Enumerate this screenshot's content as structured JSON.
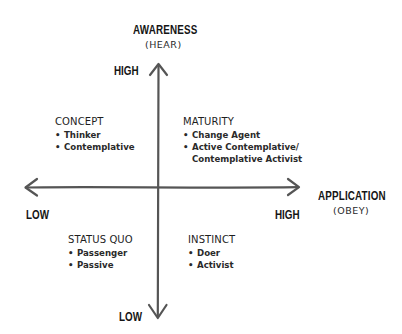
{
  "vertical_axis": {
    "title": "AWARENESS",
    "subtitle": "(HEAR)",
    "high_label": "HIGH",
    "low_label": "LOW"
  },
  "horizontal_axis": {
    "title": "APPLICATION",
    "subtitle": "(OBEY)",
    "low_label": "LOW",
    "high_label": "HIGH"
  },
  "quadrants": {
    "top_left": {
      "title": "CONCEPT",
      "items": [
        "Thinker",
        "Contemplative"
      ]
    },
    "top_right": {
      "title": "MATURITY",
      "items": [
        "Change Agent",
        "Active Contemplative/",
        "Contemplative Activist"
      ]
    },
    "bottom_left": {
      "title": "STATUS QUO",
      "items": [
        "Passenger",
        "Passive"
      ]
    },
    "bottom_right": {
      "title": "INSTINCT",
      "items": [
        "Doer",
        "Activist"
      ]
    }
  },
  "bullet": "•",
  "colors": {
    "axis_line": "#555555",
    "text": "#1e1e1e",
    "background": "#ffffff"
  }
}
